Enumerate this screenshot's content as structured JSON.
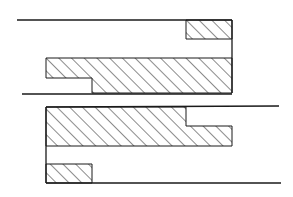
{
  "diagram": {
    "stroke_color": "#1a1a1a",
    "fill_color": "#ffffff",
    "hatch_color": "#1a1a1a",
    "views": [
      {
        "name": "upper-view",
        "parts": [
          "top-boundary-line",
          "upper-small-hatched-block",
          "main-hatched-block",
          "bottom-boundary-line",
          "right-wall"
        ]
      },
      {
        "name": "lower-view",
        "parts": [
          "top-boundary-line",
          "main-hatched-block",
          "small-hatched-block",
          "bottom-boundary-line",
          "left-wall"
        ]
      }
    ]
  }
}
